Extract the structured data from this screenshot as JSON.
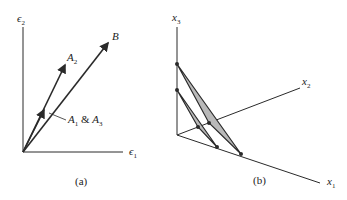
{
  "panels": [
    {
      "id": "a",
      "caption": "(a)",
      "axes": {
        "x": {
          "symbol": "ϵ",
          "sub": "1"
        },
        "y": {
          "symbol": "ϵ",
          "sub": "2"
        }
      },
      "vectors": [
        {
          "name": "B",
          "label": "B"
        },
        {
          "name": "A2",
          "label": "A",
          "sub": "2"
        },
        {
          "name": "A1&A3",
          "label_parts": [
            "A",
            "1",
            " & ",
            "A",
            "3"
          ]
        }
      ]
    },
    {
      "id": "b",
      "caption": "(b)",
      "axes": {
        "x1": {
          "symbol": "x",
          "sub": "1"
        },
        "x2": {
          "symbol": "x",
          "sub": "2"
        },
        "x3": {
          "symbol": "x",
          "sub": "3"
        }
      }
    }
  ],
  "colors": {
    "line": "#2a2a2a",
    "fill": "#b9b9b9"
  }
}
